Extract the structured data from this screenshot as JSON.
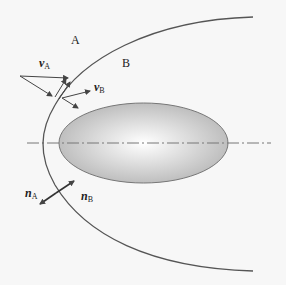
{
  "diagram": {
    "regions": {
      "a": "A",
      "b": "B"
    },
    "vectors": {
      "v_a": {
        "symbol": "v",
        "subscript": "A"
      },
      "v_b": {
        "symbol": "v",
        "subscript": "B"
      },
      "n_a": {
        "symbol": "n",
        "subscript": "A"
      },
      "n_b": {
        "symbol": "n",
        "subscript": "B"
      }
    },
    "colors": {
      "background": "#f7f7f7",
      "line": "#555555",
      "body_fill_center": "#ffffff",
      "body_fill_edge": "#b5b5b5"
    }
  }
}
